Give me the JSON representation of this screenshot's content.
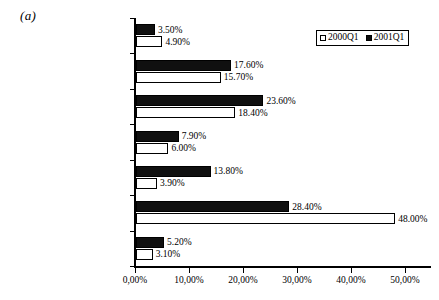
{
  "panel": {
    "label": "(a)"
  },
  "legend": {
    "position": "top-right",
    "entries": [
      {
        "name": "2000Q1",
        "marker": "open-square-icon",
        "color": "#ffffff"
      },
      {
        "name": "2001Q1",
        "marker": "filled-square-icon",
        "color": "#101010"
      }
    ]
  },
  "chart_data": {
    "type": "bar",
    "orientation": "horizontal",
    "title": "(a)",
    "xlabel": "",
    "ylabel": "",
    "xlim": [
      0,
      55
    ],
    "grid": false,
    "decimal_separator": ",",
    "value_suffix": "%",
    "legend_position": "top-right",
    "categories": [
      "Other Technology Products",
      "Media & Communications",
      "Computer Related",
      "Electronics/Semiconductors",
      "Medical/Health/Biotech",
      "Internet Related",
      "Non-Technology Products"
    ],
    "series": [
      {
        "name": "2001Q1",
        "color": "#101010",
        "values": [
          3.5,
          17.6,
          23.6,
          7.9,
          13.8,
          28.4,
          5.2
        ],
        "labels": [
          "3.50%",
          "17.60%",
          "23.60%",
          "7.90%",
          "13.80%",
          "28.40%",
          "5.20%"
        ]
      },
      {
        "name": "2000Q1",
        "color": "#ffffff",
        "values": [
          4.9,
          15.7,
          18.4,
          6.0,
          3.9,
          48.0,
          3.1
        ],
        "labels": [
          "4.90%",
          "15.70%",
          "18.40%",
          "6.00%",
          "3.90%",
          "48.00%",
          "3.10%"
        ]
      }
    ],
    "xticks": [
      0,
      10,
      20,
      30,
      40,
      50
    ],
    "xtick_labels": [
      "0,00%",
      "10,00%",
      "20,00%",
      "30,00%",
      "40,00%",
      "50,00%"
    ]
  }
}
